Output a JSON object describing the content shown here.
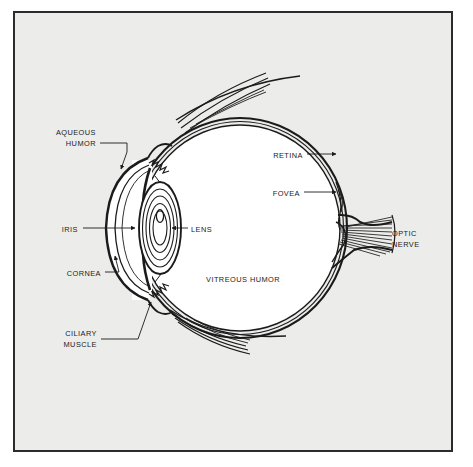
{
  "figure": {
    "background_color": "#ececeb",
    "page_color": "#ffffff",
    "frame_border_color": "#2b2b2b",
    "ink_color": "#1b1b1b",
    "interior_fill": "#ffffff"
  },
  "labels": [
    {
      "id": "aqueous-humor",
      "lines": [
        "AQUEOUS",
        "HUMOR"
      ],
      "align": "right",
      "x": 96,
      "y": 127
    },
    {
      "id": "iris",
      "lines": [
        "IRIS"
      ],
      "align": "right",
      "x": 78,
      "y": 224
    },
    {
      "id": "cornea",
      "lines": [
        "CORNEA"
      ],
      "align": "right",
      "x": 101,
      "y": 268
    },
    {
      "id": "ciliary-muscle",
      "lines": [
        "CILIARY",
        "MUSCLE"
      ],
      "align": "right",
      "x": 97,
      "y": 328
    },
    {
      "id": "lens",
      "lines": [
        "LENS"
      ],
      "align": "left",
      "x": 191,
      "y": 224
    },
    {
      "id": "vitreous-humor",
      "lines": [
        "VITREOUS HUMOR"
      ],
      "align": "left",
      "x": 206,
      "y": 274
    },
    {
      "id": "retina",
      "lines": [
        "RETINA"
      ],
      "align": "right",
      "x": 303,
      "y": 150
    },
    {
      "id": "fovea",
      "lines": [
        "FOVEA"
      ],
      "align": "right",
      "x": 300,
      "y": 188
    },
    {
      "id": "optic-nerve",
      "lines": [
        "OPTIC",
        "NERVE"
      ],
      "align": "left",
      "x": 392,
      "y": 228
    }
  ],
  "anatomy_parts": [
    "sclera",
    "choroid",
    "retina",
    "fovea",
    "optic nerve",
    "cornea",
    "iris",
    "lens",
    "ciliary muscle",
    "aqueous humor",
    "vitreous humor",
    "extraocular muscle"
  ]
}
